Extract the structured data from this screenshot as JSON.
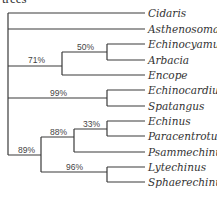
{
  "caption": "trees",
  "leaves": [
    {
      "label": "Cidaris",
      "y": 13
    },
    {
      "label": "Asthenosoma",
      "y": 29
    },
    {
      "label": "Echinocyamus",
      "y": 44
    },
    {
      "label": "Arbacia",
      "y": 60
    },
    {
      "label": "Encope",
      "y": 75
    },
    {
      "label": "Echinocardium",
      "y": 90
    },
    {
      "label": "Spatangus",
      "y": 106
    },
    {
      "label": "Echinus",
      "y": 121
    },
    {
      "label": "Paracentrotus",
      "y": 136
    },
    {
      "label": "Psammechinus",
      "y": 152
    },
    {
      "label": "Lytechinus",
      "y": 167
    },
    {
      "label": "Sphaerechinus",
      "y": 182
    }
  ],
  "support_values": {
    "clade_encope": "71%",
    "clade_echinocyamus_arbacia": "50%",
    "clade_spatangoids": "99%",
    "clade_echinoids": "89%",
    "clade_echinus_group": "88%",
    "clade_echinus_paracentrotus": "33%",
    "clade_lytechinus_sphaerechinus": "96%"
  },
  "colors": {
    "line": "#3a3a3a",
    "text": "#333333",
    "background": "#ffffff"
  }
}
